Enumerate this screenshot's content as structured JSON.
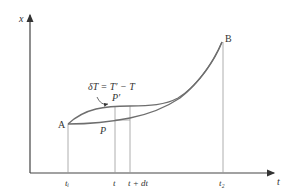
{
  "diagram": {
    "axes": {
      "y_label": "x",
      "x_label": "t"
    },
    "points": {
      "start": "A",
      "end": "B",
      "p": "P",
      "p_prime": "P′"
    },
    "annotation": "δT = T′ − T",
    "ticks": [
      "tᵢ",
      "t",
      "t + dt",
      "t₂"
    ],
    "colors": {
      "curve": "#6e6e6e",
      "guide": "#9a9a9a",
      "axis": "#444444",
      "text": "#333333"
    }
  }
}
